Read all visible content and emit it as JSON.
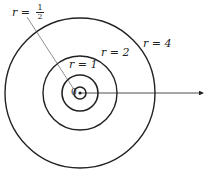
{
  "diagram": {
    "center": {
      "x": 80,
      "y": 93,
      "label": "0"
    },
    "circles": [
      {
        "r_value": "1/2",
        "radius_px": 6
      },
      {
        "r_value": "1",
        "radius_px": 18
      },
      {
        "r_value": "2",
        "radius_px": 37
      },
      {
        "r_value": "4",
        "radius_px": 75
      }
    ],
    "labels": {
      "half": {
        "var": "r",
        "eq": "=",
        "num": "1",
        "den": "2"
      },
      "one": "r = 1",
      "two": "r = 2",
      "four": "r = 4"
    },
    "stroke_color": "#222222"
  }
}
